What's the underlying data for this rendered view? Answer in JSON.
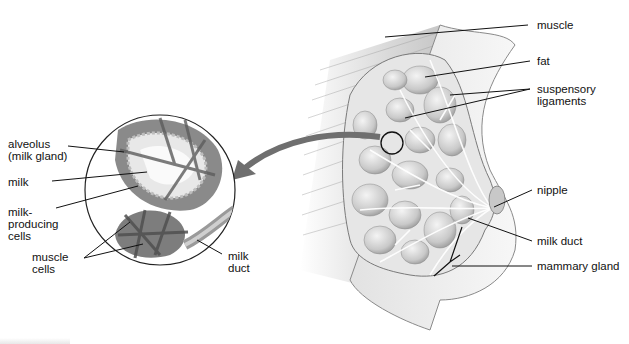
{
  "diagram": {
    "detail_inset": {
      "labels": [
        {
          "id": "alveolus",
          "text": "alveolus\n(milk gland)"
        },
        {
          "id": "milk",
          "text": "milk"
        },
        {
          "id": "milk-producing-cells",
          "text": "milk-\nproducing\ncells"
        },
        {
          "id": "muscle-cells",
          "text": "muscle\ncells"
        },
        {
          "id": "milk-duct-inset",
          "text": "milk\nduct"
        }
      ]
    },
    "main_view": {
      "labels": [
        {
          "id": "muscle",
          "text": "muscle"
        },
        {
          "id": "fat",
          "text": "fat"
        },
        {
          "id": "suspensory-ligaments",
          "text": "suspensory\nligaments"
        },
        {
          "id": "nipple",
          "text": "nipple"
        },
        {
          "id": "milk-duct",
          "text": "milk duct"
        },
        {
          "id": "mammary-gland",
          "text": "mammary gland"
        }
      ]
    },
    "colors": {
      "line": "#111111",
      "arrow": "#6f6f6f",
      "tissue": "#d9d9d9",
      "background": "#ffffff"
    }
  }
}
